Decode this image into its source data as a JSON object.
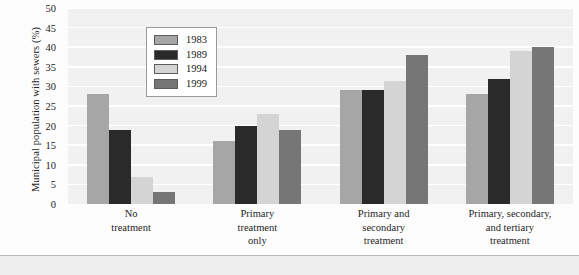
{
  "chart_data": {
    "type": "bar",
    "title": "",
    "xlabel": "",
    "ylabel": "Municipal population with sewers (%)",
    "ylim": [
      0,
      50
    ],
    "ytick_values": [
      50,
      45,
      40,
      35,
      30,
      25,
      20,
      15,
      10,
      5,
      0
    ],
    "ytick_labels": [
      "50",
      "45",
      "40",
      "35",
      "30",
      "25",
      "20",
      "15",
      "10",
      "5",
      "0"
    ],
    "grid": true,
    "legend_position": "upper-center-left",
    "categories": [
      "No treatment",
      "Primary treatment only",
      "Primary and secondary treatment",
      "Primary, secondary, and tertiary treatment"
    ],
    "category_label_lines": [
      [
        "No",
        "treatment"
      ],
      [
        "Primary",
        "treatment",
        "only"
      ],
      [
        "Primary and",
        "secondary",
        "treatment"
      ],
      [
        "Primary, secondary,",
        "and tertiary",
        "treatment"
      ]
    ],
    "series": [
      {
        "name": "1983",
        "color": "#a6a6a6",
        "values": [
          28,
          16,
          29,
          28
        ]
      },
      {
        "name": "1989",
        "color": "#2a2a2a",
        "values": [
          19,
          20,
          29,
          32
        ]
      },
      {
        "name": "1994",
        "color": "#d4d4d4",
        "values": [
          7,
          23,
          31.5,
          39
        ]
      },
      {
        "name": "1999",
        "color": "#767676",
        "values": [
          3,
          19,
          38,
          40
        ]
      }
    ]
  },
  "legend": {
    "items": [
      {
        "label": "1983",
        "color": "#a6a6a6"
      },
      {
        "label": "1989",
        "color": "#2a2a2a"
      },
      {
        "label": "1994",
        "color": "#d4d4d4"
      },
      {
        "label": "1999",
        "color": "#767676"
      }
    ]
  },
  "colors": {
    "plot_background": "#f1f1f1",
    "gridline": "#ffffff",
    "page_background": "#fdfdfd",
    "bottom_band": "#eeeeee",
    "divider": "#b9b9b9",
    "text": "#1d1d1d"
  }
}
